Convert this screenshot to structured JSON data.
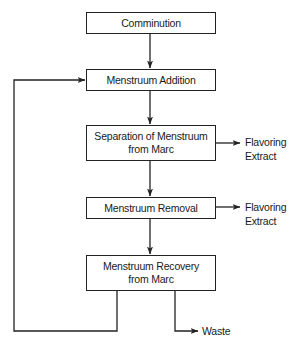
{
  "diagram": {
    "type": "process-flowchart",
    "nodes": [
      {
        "id": "comminution",
        "label": "Comminution"
      },
      {
        "id": "menstruum-addition",
        "label": "Menstruum Addition"
      },
      {
        "id": "separation",
        "label_line1": "Separation of Menstruum",
        "label_line2": "from Marc"
      },
      {
        "id": "menstruum-removal",
        "label": "Menstruum Removal"
      },
      {
        "id": "menstruum-recovery",
        "label_line1": "Menstruum Recovery",
        "label_line2": "from Marc"
      }
    ],
    "outputs": {
      "separation_output_line1": "Flavoring",
      "separation_output_line2": "Extract",
      "removal_output_line1": "Flavoring",
      "removal_output_line2": "Extract",
      "recovery_output": "Waste"
    },
    "edges": [
      {
        "from": "comminution",
        "to": "menstruum-addition"
      },
      {
        "from": "menstruum-addition",
        "to": "separation"
      },
      {
        "from": "separation",
        "to": "menstruum-removal"
      },
      {
        "from": "menstruum-removal",
        "to": "menstruum-recovery"
      },
      {
        "from": "separation",
        "to": "Flavoring Extract"
      },
      {
        "from": "menstruum-removal",
        "to": "Flavoring Extract"
      },
      {
        "from": "menstruum-recovery",
        "to": "Waste"
      },
      {
        "from": "menstruum-recovery",
        "to": "menstruum-addition",
        "note": "recycle loop"
      }
    ],
    "colors": {
      "line": "#222222",
      "text": "#1a1a1a",
      "background": "#ffffff"
    }
  }
}
